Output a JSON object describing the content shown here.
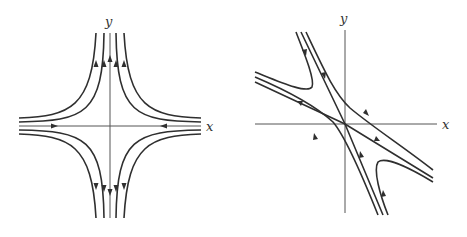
{
  "figure": {
    "left_panel": {
      "name": "saddle-axis-aligned",
      "x_axis_label": "x",
      "y_axis_label": "y",
      "flow": "incoming along x-axis, outgoing along y-axis",
      "stroke_color": "#2f2f2f"
    },
    "right_panel": {
      "name": "saddle-rotated",
      "x_axis_label": "x",
      "y_axis_label": "y",
      "flow": "incoming along steep line (top-left to bottom-right), outgoing along shallow line",
      "stroke_color": "#2f2f2f"
    }
  }
}
